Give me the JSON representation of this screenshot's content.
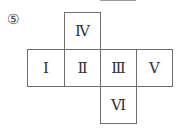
{
  "figure": {
    "label": "⑤",
    "faces": [
      {
        "id": "IV",
        "text": "Ⅳ",
        "row": 0,
        "col": 1
      },
      {
        "id": "I",
        "text": "Ⅰ",
        "row": 1,
        "col": 0
      },
      {
        "id": "II",
        "text": "Ⅱ",
        "row": 1,
        "col": 1
      },
      {
        "id": "III",
        "text": "Ⅲ",
        "row": 1,
        "col": 2
      },
      {
        "id": "V",
        "text": "Ⅴ",
        "row": 1,
        "col": 3
      },
      {
        "id": "VI",
        "text": "Ⅵ",
        "row": 2,
        "col": 2
      }
    ]
  }
}
